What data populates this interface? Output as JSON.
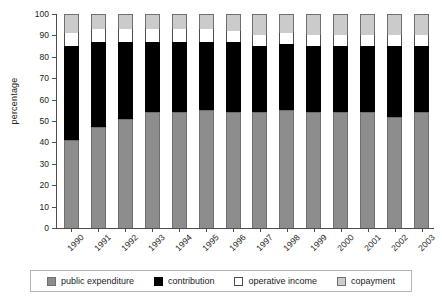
{
  "chart_data": {
    "type": "bar",
    "stacked": true,
    "title": "",
    "xlabel": "",
    "ylabel": "percentage",
    "ylim": [
      0,
      100
    ],
    "yticks": [
      0,
      10,
      20,
      30,
      40,
      50,
      60,
      70,
      80,
      90,
      100
    ],
    "grid": false,
    "legend_position": "bottom",
    "categories": [
      "1990",
      "1991",
      "1992",
      "1993",
      "1994",
      "1995",
      "1996",
      "1997",
      "1998",
      "1999",
      "2000",
      "2001",
      "2002",
      "2003"
    ],
    "series": [
      {
        "name": "public expenditure",
        "color": "#8d8d8d",
        "values": [
          41,
          47,
          51,
          54,
          54,
          55,
          54,
          54,
          55,
          54,
          54,
          54,
          52,
          54
        ]
      },
      {
        "name": "contribution",
        "color": "#000000",
        "values": [
          44,
          40,
          36,
          33,
          33,
          32,
          33,
          31,
          31,
          31,
          31,
          31,
          33,
          31
        ]
      },
      {
        "name": "operative income",
        "color": "#ffffff",
        "values": [
          6,
          6,
          6,
          6,
          6,
          6,
          5,
          5,
          5,
          5,
          5,
          5,
          5,
          5
        ]
      },
      {
        "name": "copayment",
        "color": "#cbcbcb",
        "values": [
          9,
          7,
          7,
          7,
          7,
          7,
          8,
          10,
          9,
          10,
          10,
          10,
          10,
          10
        ]
      }
    ]
  },
  "legend": {
    "items": [
      {
        "label": "public expenditure",
        "swatch": "pub"
      },
      {
        "label": "contribution",
        "swatch": "con"
      },
      {
        "label": "operative income",
        "swatch": "ope"
      },
      {
        "label": "copayment",
        "swatch": "cop"
      }
    ]
  }
}
